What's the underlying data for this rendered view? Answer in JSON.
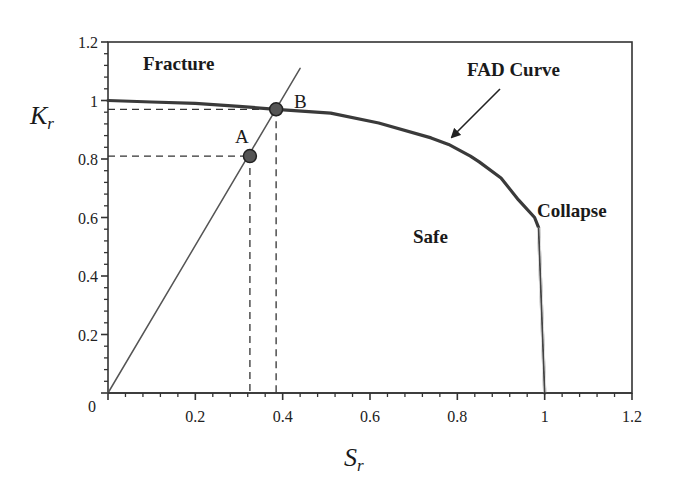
{
  "chart_data": {
    "type": "line",
    "title": "",
    "xlabel": "S_r",
    "ylabel": "K_r",
    "xlim": [
      0,
      1.2
    ],
    "ylim": [
      0,
      1.2
    ],
    "grid": false,
    "x_ticks": [
      "0.2",
      "0.4",
      "0.6",
      "0.8",
      "1",
      "1.2"
    ],
    "y_ticks": [
      "0.2",
      "0.4",
      "0.6",
      "0.8",
      "1",
      "1.2"
    ],
    "origin_label": "0",
    "series": [
      {
        "name": "FAD Curve",
        "style": "solid-thick",
        "x": [
          0,
          0.1,
          0.2,
          0.3,
          0.385,
          0.51,
          0.62,
          0.74,
          0.78,
          0.83,
          0.85,
          0.9,
          0.94,
          0.977,
          0.986,
          1.0
        ],
        "y": [
          1.0,
          0.995,
          0.99,
          0.98,
          0.97,
          0.957,
          0.923,
          0.872,
          0.85,
          0.81,
          0.79,
          0.735,
          0.66,
          0.6,
          0.565,
          0.0
        ]
      },
      {
        "name": "Load line",
        "style": "solid-thin",
        "x": [
          0,
          0.44
        ],
        "y": [
          0,
          1.11
        ]
      }
    ],
    "points": [
      {
        "label": "A",
        "x": 0.325,
        "y": 0.81
      },
      {
        "label": "B",
        "x": 0.385,
        "y": 0.97
      }
    ],
    "annotations": [
      {
        "text": "Fracture",
        "x": 0.08,
        "y": 1.12,
        "bold": true
      },
      {
        "text": "FAD Curve",
        "x": 0.82,
        "y": 1.08,
        "bold": true,
        "arrow_to": {
          "x": 0.785,
          "y": 0.87
        }
      },
      {
        "text": "Safe",
        "x": 0.7,
        "y": 0.53,
        "bold": true
      },
      {
        "text": "Collapse",
        "x": 0.98,
        "y": 0.62,
        "bold": true
      }
    ],
    "legend": "none"
  }
}
